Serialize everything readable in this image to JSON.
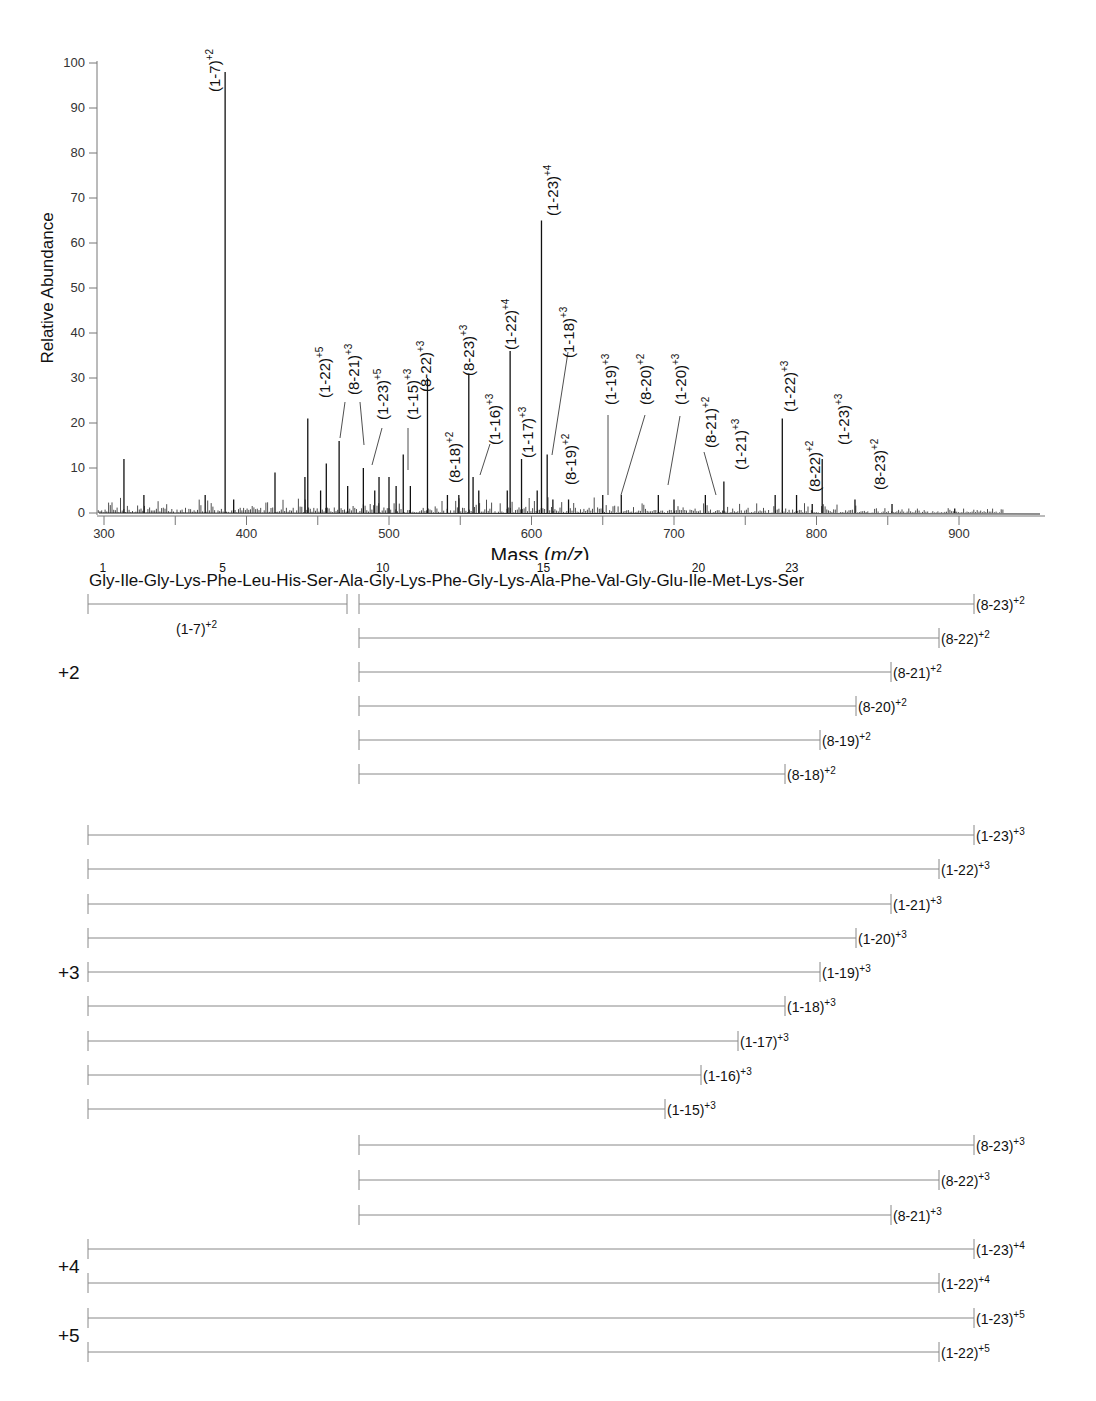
{
  "chart_data": {
    "type": "bar",
    "subtype": "mass-spectrum",
    "title": "",
    "xlabel": "Mass (m/z)",
    "xlabel_main": "Mass (",
    "xlabel_italic": "m/z",
    "xlabel_close": ")",
    "ylabel": "Relative Abundance",
    "xlim": [
      295,
      935
    ],
    "ylim": [
      0,
      100
    ],
    "x_ticks": [
      300,
      400,
      500,
      600,
      700,
      800,
      900
    ],
    "x_minor_ticks": [
      350,
      450,
      550,
      650,
      750,
      850
    ],
    "y_ticks": [
      0,
      10,
      20,
      30,
      40,
      50,
      60,
      70,
      80,
      90,
      100
    ],
    "grid": false,
    "labeled_peaks": [
      {
        "label": "(1-7)",
        "charge": "+2",
        "mz": 385,
        "abundance": 98
      },
      {
        "label": "(1-22)",
        "charge": "+5",
        "mz": 443,
        "abundance": 21
      },
      {
        "label": "(8-21)",
        "charge": "+3",
        "mz": 465,
        "abundance": 16
      },
      {
        "label": "(1-23)",
        "charge": "+5",
        "mz": 482,
        "abundance": 10
      },
      {
        "label": "(1-15)",
        "charge": "+3",
        "mz": 510,
        "abundance": 13
      },
      {
        "label": "(8-22)",
        "charge": "+3",
        "mz": 527,
        "abundance": 30
      },
      {
        "label": "(8-18)",
        "charge": "+2",
        "mz": 541,
        "abundance": 4
      },
      {
        "label": "(8-23)",
        "charge": "+3",
        "mz": 556,
        "abundance": 31
      },
      {
        "label": "(1-16)",
        "charge": "+3",
        "mz": 559,
        "abundance": 8
      },
      {
        "label": "(1-22)",
        "charge": "+4",
        "mz": 585,
        "abundance": 36
      },
      {
        "label": "(1-17)",
        "charge": "+3",
        "mz": 593,
        "abundance": 12
      },
      {
        "label": "(1-23)",
        "charge": "+4",
        "mz": 607,
        "abundance": 65
      },
      {
        "label": "(1-18)",
        "charge": "+3",
        "mz": 611,
        "abundance": 13
      },
      {
        "label": "(8-19)",
        "charge": "+2",
        "mz": 615,
        "abundance": 3
      },
      {
        "label": "(1-19)",
        "charge": "+3",
        "mz": 650,
        "abundance": 4
      },
      {
        "label": "(8-20)",
        "charge": "+2",
        "mz": 663,
        "abundance": 4
      },
      {
        "label": "(1-20)",
        "charge": "+3",
        "mz": 689,
        "abundance": 4
      },
      {
        "label": "(8-21)",
        "charge": "+2",
        "mz": 722,
        "abundance": 4
      },
      {
        "label": "(1-21)",
        "charge": "+3",
        "mz": 735,
        "abundance": 7
      },
      {
        "label": "(1-22)",
        "charge": "+3",
        "mz": 776,
        "abundance": 21
      },
      {
        "label": "(8-22)",
        "charge": "+2",
        "mz": 786,
        "abundance": 4
      },
      {
        "label": "(1-23)",
        "charge": "+3",
        "mz": 804,
        "abundance": 12
      },
      {
        "label": "(8-23)",
        "charge": "+2",
        "mz": 827,
        "abundance": 3
      }
    ],
    "other_peaks": [
      {
        "mz": 314,
        "abundance": 12
      },
      {
        "mz": 328,
        "abundance": 4
      },
      {
        "mz": 371,
        "abundance": 4
      },
      {
        "mz": 391,
        "abundance": 3
      },
      {
        "mz": 420,
        "abundance": 9
      },
      {
        "mz": 441,
        "abundance": 8
      },
      {
        "mz": 452,
        "abundance": 5
      },
      {
        "mz": 456,
        "abundance": 11
      },
      {
        "mz": 471,
        "abundance": 6
      },
      {
        "mz": 490,
        "abundance": 5
      },
      {
        "mz": 493,
        "abundance": 8
      },
      {
        "mz": 500,
        "abundance": 8
      },
      {
        "mz": 505,
        "abundance": 6
      },
      {
        "mz": 515,
        "abundance": 6
      },
      {
        "mz": 549,
        "abundance": 4
      },
      {
        "mz": 563,
        "abundance": 5
      },
      {
        "mz": 583,
        "abundance": 5
      },
      {
        "mz": 604,
        "abundance": 5
      },
      {
        "mz": 626,
        "abundance": 3
      },
      {
        "mz": 700,
        "abundance": 3
      },
      {
        "mz": 771,
        "abundance": 4
      },
      {
        "mz": 797,
        "abundance": 2
      },
      {
        "mz": 853,
        "abundance": 2
      },
      {
        "mz": 897,
        "abundance": 1
      }
    ]
  },
  "sequence": {
    "residues": [
      "Gly",
      "Ile",
      "Gly",
      "Lys",
      "Phe",
      "Leu",
      "His",
      "Ser",
      "Ala",
      "Gly",
      "Lys",
      "Phe",
      "Gly",
      "Lys",
      "Ala",
      "Phe",
      "Val",
      "Gly",
      "Glu",
      "Ile",
      "Met",
      "Lys",
      "Ser"
    ],
    "numbered_positions": [
      1,
      5,
      10,
      15,
      20,
      23
    ]
  },
  "fragment_map": {
    "groups": [
      {
        "charge_label": "+2",
        "fragments": [
          {
            "label": "(1-7)",
            "charge": "+2",
            "start": 1,
            "end": 7,
            "label_below": true
          },
          {
            "label": "(8-23)",
            "charge": "+2",
            "start": 8,
            "end": 23
          },
          {
            "label": "(8-22)",
            "charge": "+2",
            "start": 8,
            "end": 22
          },
          {
            "label": "(8-21)",
            "charge": "+2",
            "start": 8,
            "end": 21
          },
          {
            "label": "(8-20)",
            "charge": "+2",
            "start": 8,
            "end": 20
          },
          {
            "label": "(8-19)",
            "charge": "+2",
            "start": 8,
            "end": 19
          },
          {
            "label": "(8-18)",
            "charge": "+2",
            "start": 8,
            "end": 18
          }
        ]
      },
      {
        "charge_label": "+3",
        "fragments": [
          {
            "label": "(1-23)",
            "charge": "+3",
            "start": 1,
            "end": 23
          },
          {
            "label": "(1-22)",
            "charge": "+3",
            "start": 1,
            "end": 22
          },
          {
            "label": "(1-21)",
            "charge": "+3",
            "start": 1,
            "end": 21
          },
          {
            "label": "(1-20)",
            "charge": "+3",
            "start": 1,
            "end": 20
          },
          {
            "label": "(1-19)",
            "charge": "+3",
            "start": 1,
            "end": 19
          },
          {
            "label": "(1-18)",
            "charge": "+3",
            "start": 1,
            "end": 18
          },
          {
            "label": "(1-17)",
            "charge": "+3",
            "start": 1,
            "end": 17
          },
          {
            "label": "(1-16)",
            "charge": "+3",
            "start": 1,
            "end": 16
          },
          {
            "label": "(1-15)",
            "charge": "+3",
            "start": 1,
            "end": 15
          },
          {
            "label": "(8-23)",
            "charge": "+3",
            "start": 8,
            "end": 23
          },
          {
            "label": "(8-22)",
            "charge": "+3",
            "start": 8,
            "end": 22
          },
          {
            "label": "(8-21)",
            "charge": "+3",
            "start": 8,
            "end": 21
          }
        ]
      },
      {
        "charge_label": "+4",
        "fragments": [
          {
            "label": "(1-23)",
            "charge": "+4",
            "start": 1,
            "end": 23
          },
          {
            "label": "(1-22)",
            "charge": "+4",
            "start": 1,
            "end": 22
          }
        ]
      },
      {
        "charge_label": "+5",
        "fragments": [
          {
            "label": "(1-23)",
            "charge": "+5",
            "start": 1,
            "end": 23
          },
          {
            "label": "(1-22)",
            "charge": "+5",
            "start": 1,
            "end": 22
          }
        ]
      }
    ]
  }
}
